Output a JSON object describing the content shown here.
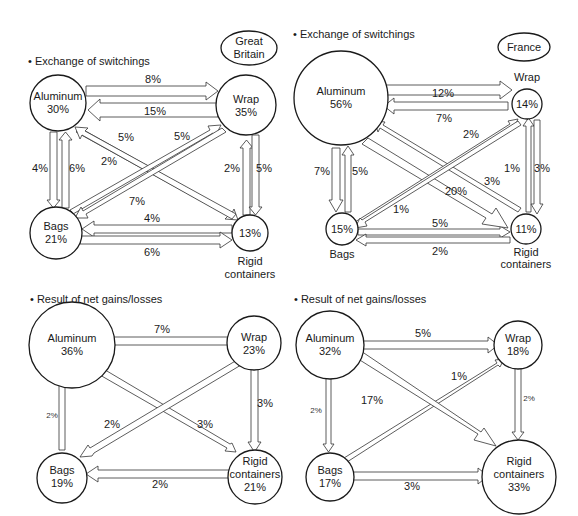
{
  "panels": {
    "gb_exchange": {
      "section_title": "• Exchange of switchings",
      "country": [
        "Great",
        "Britain"
      ],
      "nodes": {
        "aluminum": {
          "name": "Aluminum",
          "value": "30%"
        },
        "wrap": {
          "name": "Wrap",
          "value": "35%"
        },
        "bags": {
          "name": "Bags",
          "value": "21%"
        },
        "rigid": {
          "name_lines": [
            "Rigid",
            "containers"
          ],
          "value": "13%"
        }
      },
      "flows": {
        "al_to_wrap": "8%",
        "wrap_to_al": "15%",
        "al_to_rigid": "5%",
        "rigid_to_al": "2%",
        "bags_to_wrap": "5%",
        "wrap_to_bags": "7%",
        "al_to_bags": "4%",
        "bags_to_al": "6%",
        "rigid_to_wrap": "2%",
        "wrap_to_rigid": "5%",
        "rigid_to_bags": "4%",
        "bags_to_rigid": "6%"
      }
    },
    "fr_exchange": {
      "section_title": "• Exchange of switchings",
      "country": "France",
      "nodes": {
        "aluminum": {
          "name": "Aluminum",
          "value": "56%"
        },
        "wrap": {
          "name": "Wrap",
          "value": "14%"
        },
        "bags": {
          "name": "Bags",
          "value": "15%"
        },
        "rigid": {
          "name_lines": [
            "Rigid",
            "containers"
          ],
          "value": "11%"
        }
      },
      "flows": {
        "al_to_wrap": "12%",
        "wrap_to_al": "7%",
        "bags_to_wrap": "2%",
        "wrap_to_bags": "1%",
        "al_to_rigid": "20%",
        "rigid_to_al": "3%",
        "al_to_bags": "7%",
        "bags_to_al": "5%",
        "rigid_to_wrap": "1%",
        "wrap_to_rigid": "3%",
        "bags_to_rigid": "5%",
        "rigid_to_bags": "2%"
      }
    },
    "gb_net": {
      "section_title": "• Result of net gains/losses",
      "nodes": {
        "aluminum": {
          "name": "Aluminum",
          "value": "36%"
        },
        "wrap": {
          "name": "Wrap",
          "value": "23%"
        },
        "bags": {
          "name": "Bags",
          "value": "19%"
        },
        "rigid": {
          "name_lines": [
            "Rigid",
            "containers"
          ],
          "value": "21%"
        }
      },
      "flows": {
        "wrap_to_al": "7%",
        "bags_to_al": "2%",
        "wrap_to_bags": "2%",
        "al_to_rigid": "3%",
        "wrap_to_rigid": "3%",
        "rigid_to_bags": "2%"
      }
    },
    "fr_net": {
      "section_title": "• Result of net gains/losses",
      "nodes": {
        "aluminum": {
          "name": "Aluminum",
          "value": "32%"
        },
        "wrap": {
          "name": "Wrap",
          "value": "18%"
        },
        "bags": {
          "name": "Bags",
          "value": "17%"
        },
        "rigid": {
          "name_lines": [
            "Rigid",
            "containers"
          ],
          "value": "33%"
        }
      },
      "flows": {
        "al_to_wrap": "5%",
        "bags_to_wrap": "1%",
        "al_to_rigid": "17%",
        "al_to_bags": "2%",
        "wrap_to_rigid": "2%",
        "bags_to_rigid": "3%"
      }
    }
  }
}
